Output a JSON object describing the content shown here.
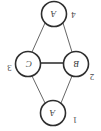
{
  "figure": {
    "type": "graph-diagram",
    "orientation": "rotated-180",
    "background_color": "#ffffff",
    "ink_color": "#3a3a3a",
    "node_fill": "#ffffff"
  },
  "nodes": [
    {
      "id": "top",
      "label": "A",
      "cx": 54,
      "cy": 14,
      "r": 12.5,
      "stroke_width": 1.6
    },
    {
      "id": "left",
      "label": "C",
      "cx": 28,
      "cy": 64,
      "r": 12.5,
      "stroke_width": 1.6
    },
    {
      "id": "right",
      "label": "B",
      "cx": 76,
      "cy": 64,
      "r": 12.5,
      "stroke_width": 1.6
    },
    {
      "id": "bottom",
      "label": "A",
      "cx": 53,
      "cy": 113,
      "r": 12.5,
      "stroke_width": 1.6
    }
  ],
  "edges": [
    {
      "id": "top-left",
      "from": "top",
      "to": "left",
      "x1": 45,
      "y1": 23,
      "x2": 32,
      "y2": 52,
      "stroke_width": 0.9
    },
    {
      "id": "top-right",
      "from": "top",
      "to": "right",
      "x1": 63,
      "y1": 23,
      "x2": 72,
      "y2": 52,
      "stroke_width": 0.9
    },
    {
      "id": "left-right",
      "from": "left",
      "to": "right",
      "x1": 41,
      "y1": 63,
      "x2": 63,
      "y2": 63,
      "stroke_width": 1.8
    },
    {
      "id": "left-bottom",
      "from": "left",
      "to": "bottom",
      "x1": 32,
      "y1": 76,
      "x2": 45,
      "y2": 103,
      "stroke_width": 0.9
    },
    {
      "id": "right-bottom",
      "from": "right",
      "to": "bottom",
      "x1": 72,
      "y1": 76,
      "x2": 61,
      "y2": 103,
      "stroke_width": 0.9
    }
  ],
  "edge_labels": [
    {
      "id": "label-4",
      "text": "4",
      "x": 73,
      "y": 15
    },
    {
      "id": "label-3",
      "text": "3",
      "x": 9,
      "y": 68
    },
    {
      "id": "label-2",
      "text": "2",
      "x": 92,
      "y": 77
    },
    {
      "id": "label-1",
      "text": "1",
      "x": 75,
      "y": 120
    }
  ]
}
